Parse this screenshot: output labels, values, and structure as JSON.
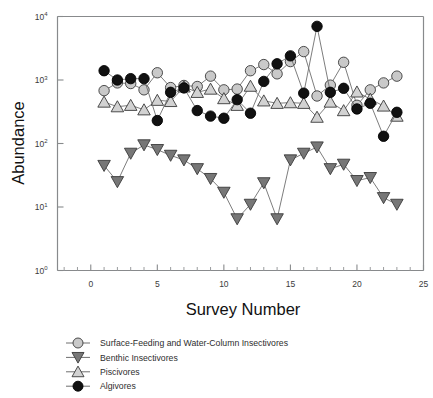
{
  "chart_data": {
    "type": "line",
    "title": "",
    "xlabel": "Survey Number",
    "ylabel": "Abundance",
    "xlim": [
      -2.5,
      25
    ],
    "ylim": [
      1,
      10000
    ],
    "yscale": "log",
    "grid": false,
    "legend_position": "below-left",
    "x_tick_labels": [
      "0",
      "5",
      "10",
      "15",
      "20",
      "25"
    ],
    "x_tick_values": [
      0,
      5,
      10,
      15,
      20,
      25
    ],
    "x_minor_tick_step": 1,
    "y_tick_labels": [
      "10⁰",
      "10¹",
      "10²",
      "10³",
      "10⁴"
    ],
    "y_tick_values": [
      1,
      10,
      100,
      1000,
      10000
    ],
    "x": [
      1,
      2,
      3,
      4,
      5,
      6,
      7,
      8,
      9,
      10,
      11,
      12,
      13,
      14,
      15,
      16,
      17,
      18,
      19,
      20,
      21,
      22,
      23
    ],
    "series": [
      {
        "name": "Surface-Feeding and  Water-Column Insectivores",
        "marker": "circle",
        "marker_fill": "#c9c9c9",
        "marker_edge": "#3a3a3a",
        "values": [
          680,
          900,
          880,
          700,
          1300,
          760,
          820,
          790,
          1150,
          700,
          720,
          1400,
          1750,
          1250,
          1950,
          2800,
          560,
          830,
          1900,
          400,
          700,
          900,
          1150
        ]
      },
      {
        "name": "Benthic Insectivores",
        "marker": "triangle-down",
        "marker_fill": "#777777",
        "marker_edge": "#3a3a3a",
        "values": [
          45,
          25,
          70,
          95,
          80,
          65,
          55,
          40,
          28,
          17,
          6.5,
          11,
          24,
          6.5,
          55,
          70,
          88,
          40,
          47,
          26,
          29,
          14,
          11
        ]
      },
      {
        "name": "Piscivores",
        "marker": "triangle-up",
        "marker_fill": "#d2d2d2",
        "marker_edge": "#3a3a3a",
        "values": [
          450,
          380,
          400,
          340,
          480,
          460,
          780,
          640,
          720,
          510,
          400,
          800,
          470,
          430,
          440,
          430,
          260,
          450,
          330,
          650,
          500,
          390,
          270
        ]
      },
      {
        "name": "Algivores",
        "marker": "circle",
        "marker_fill": "#111111",
        "marker_edge": "#000000",
        "values": [
          1400,
          1000,
          1050,
          1050,
          230,
          640,
          750,
          330,
          270,
          250,
          490,
          300,
          950,
          1800,
          2400,
          620,
          7000,
          640,
          740,
          350,
          430,
          130,
          310
        ]
      }
    ]
  },
  "legend": {
    "items": [
      {
        "label": "Surface-Feeding and  Water-Column Insectivores",
        "marker": "circle",
        "fill": "#c9c9c9"
      },
      {
        "label": "Benthic Insectivores",
        "marker": "triangle-down",
        "fill": "#777777"
      },
      {
        "label": "Piscivores",
        "marker": "triangle-up",
        "fill": "#d2d2d2"
      },
      {
        "label": "Algivores",
        "marker": "circle",
        "fill": "#111111"
      }
    ]
  }
}
